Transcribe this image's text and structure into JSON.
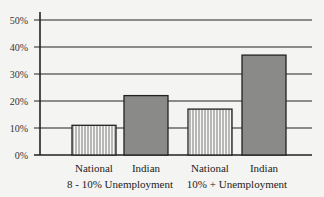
{
  "chart_data": {
    "type": "bar",
    "title": "",
    "xlabel": "",
    "ylabel": "",
    "ylim": [
      0,
      50
    ],
    "yticks": [
      "0%",
      "10%",
      "20%",
      "30%",
      "40%",
      "50%"
    ],
    "grid": true,
    "groups": [
      {
        "label": "8 - 10% Unemployment",
        "bars": [
          {
            "category": "National",
            "value": 11,
            "pattern": "vertical-stripes"
          },
          {
            "category": "Indian",
            "value": 22,
            "pattern": "dark-gray"
          }
        ]
      },
      {
        "label": "10% + Unemployment",
        "bars": [
          {
            "category": "National",
            "value": 17,
            "pattern": "vertical-stripes"
          },
          {
            "category": "Indian",
            "value": 37,
            "pattern": "dark-gray"
          }
        ]
      }
    ],
    "colors": {
      "dark": "#8a8a88",
      "stripe": "#555555",
      "light": "#f8f8f6"
    }
  }
}
